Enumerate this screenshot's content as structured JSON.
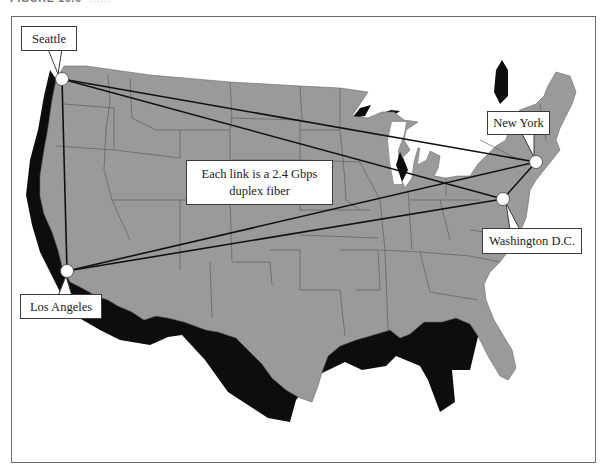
{
  "figure": {
    "caption_label": "FIGURE 10.6",
    "caption_rest": "......"
  },
  "annotation": {
    "line1": "Each link is a 2.4 Gbps",
    "line2": "duplex fiber"
  },
  "nodes": [
    {
      "id": "seattle",
      "label": "Seattle",
      "x": 62,
      "y": 79
    },
    {
      "id": "new-york",
      "label": "New York",
      "x": 536,
      "y": 162
    },
    {
      "id": "washington-dc",
      "label": "Washington D.C.",
      "x": 503,
      "y": 199
    },
    {
      "id": "los-angeles",
      "label": "Los Angeles",
      "x": 67,
      "y": 271
    }
  ],
  "links": [
    {
      "from": "Seattle",
      "to": "Los Angeles",
      "capacity": "2.4 Gbps duplex fiber"
    },
    {
      "from": "Seattle",
      "to": "New York",
      "capacity": "2.4 Gbps duplex fiber"
    },
    {
      "from": "Seattle",
      "to": "Washington D.C.",
      "capacity": "2.4 Gbps duplex fiber"
    },
    {
      "from": "Los Angeles",
      "to": "New York",
      "capacity": "2.4 Gbps duplex fiber"
    },
    {
      "from": "Los Angeles",
      "to": "Washington D.C.",
      "capacity": "2.4 Gbps duplex fiber"
    },
    {
      "from": "New York",
      "to": "Washington D.C.",
      "capacity": "2.4 Gbps duplex fiber"
    }
  ],
  "colors": {
    "land": "#9a9a9a",
    "shadow": "#0d0d0d",
    "borders": "#5e5e5e",
    "link": "#111111",
    "node_fill": "#ffffff"
  }
}
